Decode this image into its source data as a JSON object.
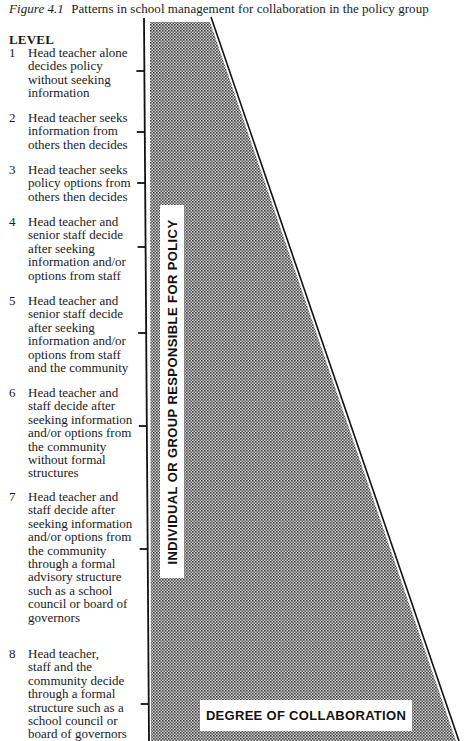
{
  "caption": {
    "figure_label": "Figure 4.1",
    "title": "Patterns in school management for collaboration in the policy group"
  },
  "levels_heading": "LEVEL",
  "levels": [
    {
      "number": "1",
      "text": "Head teacher alone\ndecides policy\nwithout seeking\ninformation",
      "top": 46,
      "tick_y": 71
    },
    {
      "number": "2",
      "text": "Head teacher seeks\ninformation from\nothers then decides",
      "top": 111,
      "tick_y": 132
    },
    {
      "number": "3",
      "text": "Head teacher seeks\npolicy options from\nothers then decides",
      "top": 163,
      "tick_y": 183
    },
    {
      "number": "4",
      "text": "Head teacher and\nsenior staff decide\nafter seeking\ninformation and/or\noptions from staff",
      "top": 215,
      "tick_y": 247
    },
    {
      "number": "5",
      "text": "Head teacher and\nsenior staff decide\nafter seeking\ninformation and/or\noptions from staff\nand the community",
      "top": 294,
      "tick_y": 333
    },
    {
      "number": "6",
      "text": "Head teacher and\nstaff decide after\nseeking information\nand/or options from\nthe community\nwithout formal\nstructures",
      "top": 386,
      "tick_y": 426
    },
    {
      "number": "7",
      "text": "Head teacher and\nstaff decide after\nseeking information\nand/or options from\nthe community\nthrough a formal\nadvisory structure\nsuch as a school\ncouncil or board of\ngovernors",
      "top": 490,
      "tick_y": 549
    },
    {
      "number": "8",
      "text": "Head teacher,\nstaff and the\ncommunity decide\nthrough a formal\nstructure such as a\nschool council or\nboard of governors",
      "top": 647,
      "tick_y": 704
    }
  ],
  "diagram": {
    "vertical_axis_label": "INDIVIDUAL OR GROUP RESPONSIBLE FOR POLICY",
    "horizontal_axis_label": "DEGREE OF COLLABORATION",
    "shade_color": "#8a8a8a",
    "line_color": "#111111"
  }
}
